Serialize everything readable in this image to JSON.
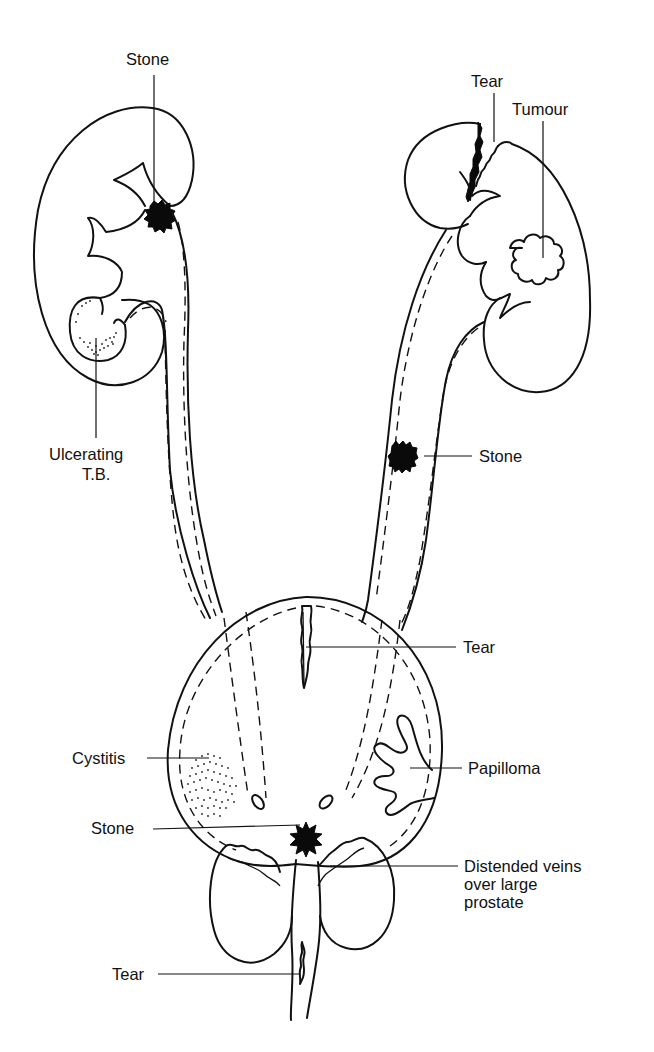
{
  "figure": {
    "labels": {
      "kidney_right_stone": "Stone",
      "kidney_right_tb_line1": "Ulcerating",
      "kidney_right_tb_line2": "T.B.",
      "kidney_left_tear": "Tear",
      "kidney_left_tumour": "Tumour",
      "ureter_left_stone": "Stone",
      "bladder_tear": "Tear",
      "bladder_cystitis": "Cystitis",
      "bladder_papilloma": "Papilloma",
      "bladder_neck_stone": "Stone",
      "prostate_veins_line1": "Distended veins",
      "prostate_veins_line2": "over large",
      "prostate_veins_line3": "prostate",
      "urethra_tear": "Tear"
    },
    "colors": {
      "ink": "#111111",
      "background": "#ffffff"
    }
  }
}
